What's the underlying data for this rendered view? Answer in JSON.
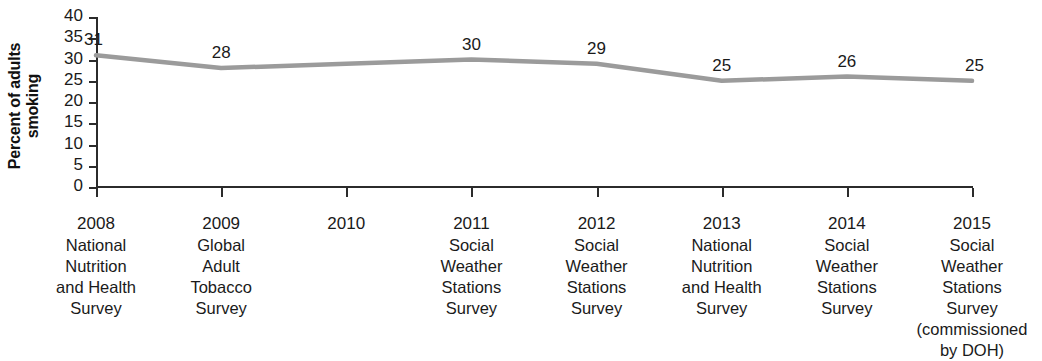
{
  "chart_data": {
    "type": "line",
    "title": "",
    "xlabel": "",
    "ylabel": "Percent of adults smoking",
    "ylim": [
      0,
      40
    ],
    "y_ticks": [
      40,
      35,
      30,
      25,
      20,
      15,
      10,
      5,
      0
    ],
    "grid": false,
    "legend": null,
    "line_color": "#9b9b9b",
    "categories": [
      "2008",
      "2009",
      "2010",
      "2011",
      "2012",
      "2013",
      "2014",
      "2015"
    ],
    "category_sublabels": [
      "National\nNutrition\nand Health\nSurvey",
      "Global\nAdult\nTobacco\nSurvey",
      "",
      "Social\nWeather\nStations\nSurvey",
      "Social\nWeather\nStations\nSurvey",
      "National\nNutrition\nand Health\nSurvey",
      "Social\nWeather\nStations\nSurvey",
      "Social\nWeather\nStations\nSurvey\n(commissioned\nby DOH)"
    ],
    "values": [
      31,
      28,
      null,
      30,
      29,
      25,
      26,
      25
    ],
    "point_labels": [
      "31",
      "28",
      "",
      "30",
      "29",
      "25",
      "26",
      "25"
    ],
    "series": [
      {
        "name": "Percent of adults smoking",
        "values": [
          31,
          28,
          null,
          30,
          29,
          25,
          26,
          25
        ]
      }
    ]
  }
}
